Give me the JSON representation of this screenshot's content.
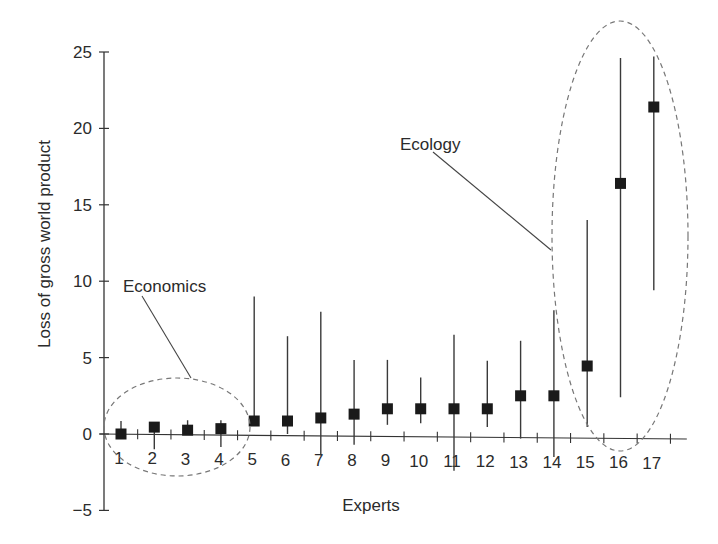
{
  "chart_data": {
    "type": "scatter",
    "subtype": "error-bar",
    "title": "",
    "xlabel": "Experts",
    "ylabel": "Loss of gross world product",
    "ylim": [
      -5,
      25
    ],
    "xlim": [
      0.5,
      17.5
    ],
    "yticks": [
      -5,
      0,
      5,
      10,
      15,
      20,
      25
    ],
    "ytick_labels": [
      "−5",
      "0",
      "5",
      "10",
      "15",
      "20",
      "25"
    ],
    "xticks": [
      1,
      2,
      3,
      4,
      5,
      6,
      7,
      8,
      9,
      10,
      11,
      12,
      13,
      14,
      15,
      16,
      17
    ],
    "grid": false,
    "legend": null,
    "series": [
      {
        "name": "Expert estimates",
        "marker": "square",
        "x": [
          1,
          2,
          3,
          4,
          5,
          6,
          7,
          8,
          9,
          10,
          11,
          12,
          13,
          14,
          15,
          16,
          17
        ],
        "values": [
          0.0,
          0.45,
          0.25,
          0.35,
          0.85,
          0.85,
          1.05,
          1.3,
          1.65,
          1.65,
          1.65,
          1.65,
          2.5,
          2.5,
          4.45,
          16.4,
          21.4
        ],
        "lower": [
          0.0,
          -1.0,
          0.25,
          -0.85,
          0.85,
          0.0,
          -1.4,
          -0.7,
          0.6,
          0.7,
          -2.4,
          0.45,
          -0.3,
          -1.5,
          0.45,
          2.4,
          9.4
        ],
        "upper": [
          0.85,
          0.45,
          0.9,
          0.9,
          9.0,
          6.4,
          8.0,
          4.85,
          4.85,
          3.7,
          6.5,
          4.8,
          6.1,
          8.1,
          14.0,
          24.6,
          24.7
        ]
      }
    ],
    "annotations": [
      {
        "text": "Economics",
        "encircles_experts": [
          1,
          2,
          3,
          4
        ]
      },
      {
        "text": "Ecology",
        "encircles_experts": [
          15,
          16,
          17
        ]
      }
    ]
  },
  "labels": {
    "xlabel": "Experts",
    "ylabel": "Loss of gross world product",
    "economics": "Economics",
    "ecology": "Ecology"
  }
}
